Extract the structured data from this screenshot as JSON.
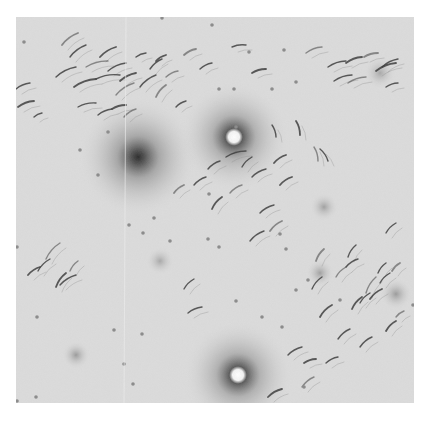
{
  "image": {
    "kind": "grayscale micrograph",
    "frame": {
      "x": 16,
      "y": 17,
      "width": 398,
      "height": 386
    },
    "background": "#dcdcdc",
    "rod_color": "#3a3a3a",
    "dot_color": "#8a8a8a",
    "halos": [
      {
        "cx": 122,
        "cy": 140,
        "r": 60,
        "core": "#2e2e2e",
        "type": "dark"
      },
      {
        "cx": 218,
        "cy": 120,
        "r": 55,
        "core": "#ffffff",
        "type": "bright"
      },
      {
        "cx": 222,
        "cy": 358,
        "r": 55,
        "core": "#ffffff",
        "type": "bright"
      },
      {
        "cx": 60,
        "cy": 338,
        "r": 14,
        "core": "#9a9a9a",
        "type": "faint"
      },
      {
        "cx": 144,
        "cy": 244,
        "r": 14,
        "core": "#a8a8a8",
        "type": "faint"
      },
      {
        "cx": 308,
        "cy": 190,
        "r": 14,
        "core": "#a0a0a0",
        "type": "faint"
      },
      {
        "cx": 304,
        "cy": 256,
        "r": 14,
        "core": "#a0a0a0",
        "type": "faint"
      },
      {
        "cx": 364,
        "cy": 56,
        "r": 16,
        "core": "#a8a8a8",
        "type": "faint"
      },
      {
        "cx": 380,
        "cy": 277,
        "r": 16,
        "core": "#9a9a9a",
        "type": "faint"
      }
    ],
    "rods": [
      [
        46,
        28,
        62,
        16
      ],
      [
        54,
        40,
        70,
        28
      ],
      [
        40,
        60,
        60,
        50
      ],
      [
        58,
        70,
        80,
        62
      ],
      [
        70,
        50,
        92,
        44
      ],
      [
        80,
        62,
        104,
        58
      ],
      [
        84,
        40,
        100,
        30
      ],
      [
        92,
        54,
        110,
        46
      ],
      [
        100,
        78,
        118,
        66
      ],
      [
        104,
        64,
        120,
        56
      ],
      [
        124,
        70,
        140,
        58
      ],
      [
        134,
        52,
        146,
        42
      ],
      [
        140,
        80,
        150,
        68
      ],
      [
        62,
        90,
        80,
        86
      ],
      [
        82,
        98,
        96,
        92
      ],
      [
        96,
        92,
        110,
        88
      ],
      [
        108,
        100,
        120,
        92
      ],
      [
        0,
        72,
        14,
        66
      ],
      [
        2,
        90,
        18,
        84
      ],
      [
        18,
        100,
        26,
        96
      ],
      [
        150,
        60,
        162,
        54
      ],
      [
        140,
        44,
        150,
        38
      ],
      [
        120,
        40,
        130,
        36
      ],
      [
        160,
        90,
        170,
        84
      ],
      [
        168,
        38,
        180,
        32
      ],
      [
        184,
        52,
        196,
        46
      ],
      [
        216,
        30,
        230,
        28
      ],
      [
        236,
        56,
        250,
        52
      ],
      [
        290,
        36,
        306,
        30
      ],
      [
        312,
        50,
        330,
        44
      ],
      [
        330,
        46,
        346,
        40
      ],
      [
        318,
        64,
        336,
        58
      ],
      [
        332,
        66,
        350,
        60
      ],
      [
        360,
        54,
        380,
        46
      ],
      [
        370,
        70,
        382,
        66
      ],
      [
        366,
        50,
        382,
        42
      ],
      [
        348,
        40,
        362,
        36
      ],
      [
        210,
        140,
        230,
        134
      ],
      [
        256,
        108,
        260,
        120
      ],
      [
        280,
        104,
        284,
        118
      ],
      [
        298,
        130,
        302,
        144
      ],
      [
        304,
        132,
        312,
        144
      ],
      [
        258,
        146,
        270,
        138
      ],
      [
        236,
        160,
        250,
        152
      ],
      [
        214,
        176,
        226,
        168
      ],
      [
        196,
        192,
        206,
        180
      ],
      [
        244,
        196,
        258,
        188
      ],
      [
        178,
        168,
        190,
        160
      ],
      [
        158,
        176,
        168,
        168
      ],
      [
        192,
        152,
        204,
        144
      ],
      [
        226,
        150,
        236,
        140
      ],
      [
        264,
        168,
        276,
        160
      ],
      [
        30,
        242,
        44,
        226
      ],
      [
        22,
        254,
        34,
        242
      ],
      [
        40,
        270,
        50,
        256
      ],
      [
        44,
        268,
        60,
        258
      ],
      [
        54,
        254,
        62,
        244
      ],
      [
        12,
        258,
        24,
        250
      ],
      [
        168,
        272,
        178,
        262
      ],
      [
        172,
        296,
        186,
        290
      ],
      [
        254,
        214,
        266,
        204
      ],
      [
        234,
        224,
        248,
        214
      ],
      [
        296,
        272,
        306,
        260
      ],
      [
        304,
        300,
        316,
        288
      ],
      [
        320,
        260,
        330,
        250
      ],
      [
        330,
        250,
        342,
        242
      ],
      [
        336,
        292,
        346,
        280
      ],
      [
        344,
        286,
        354,
        276
      ],
      [
        350,
        276,
        360,
        260
      ],
      [
        354,
        282,
        366,
        272
      ],
      [
        362,
        256,
        370,
        246
      ],
      [
        364,
        266,
        374,
        256
      ],
      [
        376,
        254,
        384,
        246
      ],
      [
        322,
        322,
        334,
        312
      ],
      [
        344,
        330,
        356,
        320
      ],
      [
        370,
        314,
        380,
        304
      ],
      [
        380,
        300,
        388,
        294
      ],
      [
        272,
        338,
        286,
        330
      ],
      [
        288,
        346,
        300,
        342
      ],
      [
        310,
        346,
        322,
        340
      ],
      [
        286,
        370,
        298,
        360
      ],
      [
        252,
        380,
        266,
        372
      ],
      [
        370,
        216,
        380,
        206
      ],
      [
        332,
        240,
        340,
        228
      ],
      [
        300,
        244,
        308,
        232
      ]
    ],
    "dots": [
      [
        8,
        25
      ],
      [
        146,
        1
      ],
      [
        196,
        8
      ],
      [
        92,
        115
      ],
      [
        64,
        133
      ],
      [
        82,
        158
      ],
      [
        233,
        35
      ],
      [
        268,
        33
      ],
      [
        280,
        65
      ],
      [
        256,
        72
      ],
      [
        203,
        72
      ],
      [
        218,
        72
      ],
      [
        220,
        110
      ],
      [
        193,
        177
      ],
      [
        138,
        201
      ],
      [
        154,
        224
      ],
      [
        127,
        216
      ],
      [
        113,
        208
      ],
      [
        192,
        222
      ],
      [
        203,
        230
      ],
      [
        264,
        217
      ],
      [
        270,
        232
      ],
      [
        1,
        230
      ],
      [
        21,
        300
      ],
      [
        98,
        313
      ],
      [
        108,
        347
      ],
      [
        126,
        317
      ],
      [
        117,
        367
      ],
      [
        292,
        263
      ],
      [
        280,
        273
      ],
      [
        246,
        300
      ],
      [
        220,
        284
      ],
      [
        266,
        310
      ],
      [
        324,
        283
      ],
      [
        397,
        288
      ],
      [
        288,
        370
      ],
      [
        1,
        384
      ],
      [
        20,
        380
      ]
    ]
  }
}
